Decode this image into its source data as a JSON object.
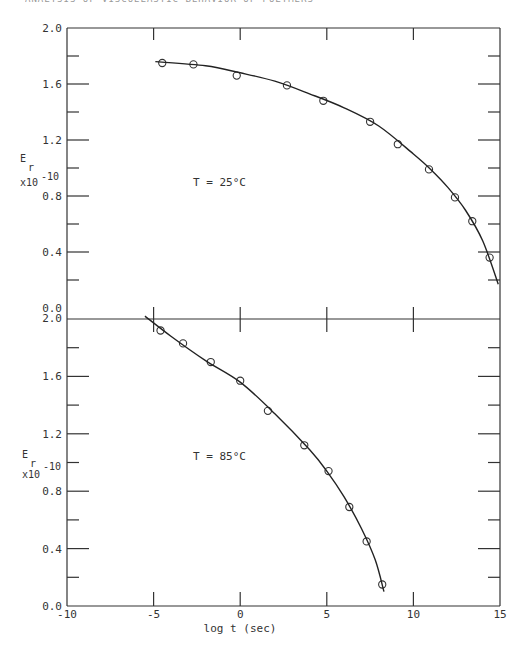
{
  "page": {
    "running_head": "ANALYSIS OF VISCOELASTIC BEHAVIOR OF POLYMERS"
  },
  "chart_data": [
    {
      "type": "scatter",
      "panel": "top",
      "title": "",
      "annotation": "T = 25°C",
      "xlabel": "log t (sec)",
      "ylabel": "E_r x10^-10",
      "ylabel_parts": {
        "main": "E",
        "sub": "r",
        "mult": "x10",
        "exp": "-10"
      },
      "xlim": [
        -10,
        15
      ],
      "ylim": [
        0.0,
        2.0
      ],
      "y_ticks": [
        "0.0",
        "0.4",
        "0.8",
        "1.2",
        "1.6",
        "2.0"
      ],
      "x_ticks": [
        -10,
        -5,
        0,
        5,
        10,
        15
      ],
      "grid": false,
      "series": [
        {
          "name": "measured",
          "marker": "open-circle",
          "x": [
            -4.5,
            -2.7,
            -0.2,
            2.7,
            4.8,
            7.5,
            9.1,
            10.9,
            12.4,
            13.4,
            14.4
          ],
          "y": [
            1.75,
            1.74,
            1.66,
            1.59,
            1.48,
            1.33,
            1.17,
            0.99,
            0.79,
            0.62,
            0.36
          ]
        },
        {
          "name": "fitted curve",
          "marker": "line",
          "x": [
            -4.9,
            -2,
            0,
            2,
            4,
            6,
            8,
            10,
            11,
            12,
            13,
            14,
            14.9
          ],
          "y": [
            1.76,
            1.73,
            1.68,
            1.62,
            1.53,
            1.43,
            1.3,
            1.1,
            0.99,
            0.86,
            0.7,
            0.48,
            0.17
          ]
        }
      ]
    },
    {
      "type": "scatter",
      "panel": "bottom",
      "title": "",
      "annotation": "T = 85°C",
      "xlabel": "log t (sec)",
      "ylabel": "E_r x10^-10",
      "ylabel_parts": {
        "main": "E",
        "sub": "r",
        "mult": "x10",
        "exp": "-10"
      },
      "xlim": [
        -10,
        15
      ],
      "ylim": [
        0.0,
        2.0
      ],
      "y_ticks": [
        "0.0",
        "0.4",
        "0.8",
        "1.2",
        "1.6",
        "2.0"
      ],
      "x_ticks": [
        "-10",
        "-5",
        "0",
        "5",
        "10",
        "15"
      ],
      "grid": false,
      "series": [
        {
          "name": "measured",
          "marker": "open-circle",
          "x": [
            -4.6,
            -3.3,
            -1.7,
            0.0,
            1.6,
            3.7,
            5.1,
            6.3,
            7.3,
            8.2
          ],
          "y": [
            1.92,
            1.83,
            1.7,
            1.57,
            1.36,
            1.12,
            0.94,
            0.69,
            0.45,
            0.15
          ]
        },
        {
          "name": "fitted curve",
          "marker": "line",
          "x": [
            -5.5,
            -4,
            -2,
            0,
            2,
            4,
            5,
            6,
            7,
            7.8,
            8.3
          ],
          "y": [
            2.02,
            1.88,
            1.71,
            1.56,
            1.34,
            1.09,
            0.94,
            0.76,
            0.54,
            0.32,
            0.1
          ]
        }
      ]
    }
  ],
  "axes": {
    "y_tick_labels_top": [
      "2.0",
      "1.6",
      "1.2",
      "0.8",
      "0.4",
      "0.0"
    ],
    "y_tick_labels_bottom": [
      "2.0",
      "1.6",
      "1.2",
      "0.8",
      "0.4",
      "0.0"
    ],
    "x_tick_labels": [
      "-10",
      "-5",
      "0",
      "5",
      "10",
      "15"
    ],
    "x_axis_title": "log t (sec)",
    "ylabel_main": "E",
    "ylabel_sub": "r",
    "ylabel_mult": "x10",
    "ylabel_exp": "-10"
  },
  "annotations": {
    "top": "T = 25°C",
    "bottom": "T = 85°C"
  }
}
